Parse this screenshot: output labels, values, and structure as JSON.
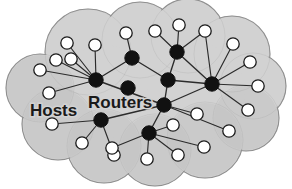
{
  "figure": {
    "width": 292,
    "height": 189,
    "background_color": "#ffffff"
  },
  "cloud": {
    "name": "network-cloud",
    "fill_color": "#d2d2d2",
    "fill_color_dark": "#c2c2c2",
    "stroke_color": "#8f8f8f",
    "stroke_width": 1.1,
    "lobes": [
      {
        "cx": 88,
        "cy": 52,
        "r": 43
      },
      {
        "cx": 140,
        "cy": 40,
        "r": 38
      },
      {
        "cx": 188,
        "cy": 36,
        "r": 37
      },
      {
        "cx": 232,
        "cy": 54,
        "r": 38
      },
      {
        "cx": 253,
        "cy": 86,
        "r": 33
      },
      {
        "cx": 246,
        "cy": 118,
        "r": 33
      },
      {
        "cx": 205,
        "cy": 140,
        "r": 38
      },
      {
        "cx": 155,
        "cy": 150,
        "r": 36
      },
      {
        "cx": 104,
        "cy": 146,
        "r": 37
      },
      {
        "cx": 58,
        "cy": 124,
        "r": 36
      },
      {
        "cx": 40,
        "cy": 88,
        "r": 34
      },
      {
        "cx": 150,
        "cy": 92,
        "r": 62
      },
      {
        "cx": 104,
        "cy": 92,
        "r": 48
      },
      {
        "cx": 196,
        "cy": 92,
        "r": 50
      }
    ]
  },
  "labels": [
    {
      "name": "hosts-label",
      "text": "Hosts",
      "x": 30,
      "y": 116,
      "font_size": 17
    },
    {
      "name": "routers-label",
      "text": "Routers",
      "x": 88,
      "y": 108,
      "font_size": 17
    }
  ],
  "legend": {
    "router_color": "#111111",
    "host_fill": "#ffffff",
    "host_stroke": "#1a1a1a",
    "link_color": "#2b2b2b",
    "router_label": "Routers",
    "host_label": "Hosts"
  },
  "nodes": {
    "routers": [
      {
        "id": "R1",
        "name": "router-top-left",
        "x": 96,
        "y": 80,
        "r": 7.2
      },
      {
        "id": "R2",
        "name": "router-upper-mid",
        "x": 132,
        "y": 58,
        "r": 7.2
      },
      {
        "id": "R3",
        "name": "router-top-center",
        "x": 177,
        "y": 52,
        "r": 7.2
      },
      {
        "id": "R4",
        "name": "router-center",
        "x": 168,
        "y": 80,
        "r": 7.2
      },
      {
        "id": "R5",
        "name": "router-hub",
        "x": 164,
        "y": 105,
        "r": 7.2
      },
      {
        "id": "R6",
        "name": "router-right",
        "x": 212,
        "y": 84,
        "r": 7.2
      },
      {
        "id": "R7",
        "name": "router-mid-stub",
        "x": 128,
        "y": 88,
        "r": 7.2
      },
      {
        "id": "R8",
        "name": "router-lower-left",
        "x": 101,
        "y": 120,
        "r": 7.2
      },
      {
        "id": "R9",
        "name": "router-lower-center",
        "x": 149,
        "y": 133,
        "r": 7.2
      }
    ],
    "hosts": [
      {
        "id": "H1",
        "name": "host-1",
        "x": 56,
        "y": 60,
        "r": 6.2
      },
      {
        "id": "H2",
        "name": "host-2",
        "x": 71,
        "y": 59,
        "r": 6.2
      },
      {
        "id": "H3",
        "name": "host-3",
        "x": 95,
        "y": 45,
        "r": 6.2
      },
      {
        "id": "H4",
        "name": "host-4",
        "x": 67,
        "y": 43,
        "r": 6.2
      },
      {
        "id": "H5",
        "name": "host-5",
        "x": 49,
        "y": 93,
        "r": 6.2
      },
      {
        "id": "H6",
        "name": "host-6",
        "x": 126,
        "y": 33,
        "r": 6.2
      },
      {
        "id": "H7",
        "name": "host-7",
        "x": 155,
        "y": 31,
        "r": 6.2
      },
      {
        "id": "H8",
        "name": "host-8",
        "x": 179,
        "y": 25,
        "r": 6.2
      },
      {
        "id": "H9",
        "name": "host-9",
        "x": 205,
        "y": 31,
        "r": 6.2
      },
      {
        "id": "H10",
        "name": "host-10",
        "x": 233,
        "y": 44,
        "r": 6.2
      },
      {
        "id": "H11",
        "name": "host-11",
        "x": 250,
        "y": 62,
        "r": 6.2
      },
      {
        "id": "H12",
        "name": "host-12",
        "x": 258,
        "y": 86,
        "r": 6.2
      },
      {
        "id": "H13",
        "name": "host-13",
        "x": 248,
        "y": 110,
        "r": 6.2
      },
      {
        "id": "H14",
        "name": "host-14",
        "x": 229,
        "y": 131,
        "r": 6.2
      },
      {
        "id": "H15",
        "name": "host-15",
        "x": 204,
        "y": 147,
        "r": 6.2
      },
      {
        "id": "H16",
        "name": "host-16",
        "x": 178,
        "y": 155,
        "r": 6.2
      },
      {
        "id": "H17",
        "name": "host-17",
        "x": 147,
        "y": 159,
        "r": 6.2
      },
      {
        "id": "H18",
        "name": "host-18",
        "x": 197,
        "y": 114,
        "r": 6.2
      },
      {
        "id": "H19",
        "name": "host-19",
        "x": 173,
        "y": 125,
        "r": 6.2
      },
      {
        "id": "H20",
        "name": "host-20",
        "x": 114,
        "y": 155,
        "r": 6.2
      },
      {
        "id": "H21",
        "name": "host-21",
        "x": 82,
        "y": 143,
        "r": 6.2
      },
      {
        "id": "H22",
        "name": "host-22",
        "x": 52,
        "y": 124,
        "r": 6.2
      },
      {
        "id": "H23",
        "name": "host-23",
        "x": 40,
        "y": 70,
        "r": 6.2
      },
      {
        "id": "H24",
        "name": "host-24",
        "x": 112,
        "y": 148,
        "r": 6.2
      }
    ]
  },
  "links": {
    "router_links": [
      {
        "name": "link-R1-R2",
        "from": "R1",
        "to": "R2"
      },
      {
        "name": "link-R2-R4",
        "from": "R2",
        "to": "R4"
      },
      {
        "name": "link-R3-R4",
        "from": "R3",
        "to": "R4"
      },
      {
        "name": "link-R4-R5",
        "from": "R4",
        "to": "R5"
      },
      {
        "name": "link-R4-R6",
        "from": "R4",
        "to": "R6"
      },
      {
        "name": "link-R5-R6",
        "from": "R5",
        "to": "R6"
      },
      {
        "name": "link-R5-R1",
        "from": "R5",
        "to": "R1"
      },
      {
        "name": "link-R5-R8",
        "from": "R5",
        "to": "R8"
      },
      {
        "name": "link-R5-R9",
        "from": "R5",
        "to": "R9"
      },
      {
        "name": "link-R3-R6",
        "from": "R3",
        "to": "R6"
      }
    ],
    "host_links": [
      {
        "name": "link-H1-R1",
        "from": "H1",
        "to": "R1"
      },
      {
        "name": "link-H2-R1",
        "from": "H2",
        "to": "R1"
      },
      {
        "name": "link-H3-R1",
        "from": "H3",
        "to": "R1"
      },
      {
        "name": "link-H4-R1",
        "from": "H4",
        "to": "R1"
      },
      {
        "name": "link-H23-R1",
        "from": "H23",
        "to": "R1"
      },
      {
        "name": "link-H5-R1",
        "from": "H5",
        "to": "R1"
      },
      {
        "name": "link-H6-R2",
        "from": "H6",
        "to": "R2"
      },
      {
        "name": "link-H7-R3",
        "from": "H7",
        "to": "R3"
      },
      {
        "name": "link-H8-R3",
        "from": "H8",
        "to": "R3"
      },
      {
        "name": "link-H9-R3",
        "from": "H9",
        "to": "R3"
      },
      {
        "name": "link-H9-R6",
        "from": "H9",
        "to": "R6"
      },
      {
        "name": "link-H10-R6",
        "from": "H10",
        "to": "R6"
      },
      {
        "name": "link-H11-R6",
        "from": "H11",
        "to": "R6"
      },
      {
        "name": "link-H12-R6",
        "from": "H12",
        "to": "R6"
      },
      {
        "name": "link-H13-R6",
        "from": "H13",
        "to": "R6"
      },
      {
        "name": "link-H14-R5",
        "from": "H14",
        "to": "R5"
      },
      {
        "name": "link-H18-R5",
        "from": "H18",
        "to": "R5"
      },
      {
        "name": "link-H19-R9",
        "from": "H19",
        "to": "R9"
      },
      {
        "name": "link-H15-R9",
        "from": "H15",
        "to": "R9"
      },
      {
        "name": "link-H16-R9",
        "from": "H16",
        "to": "R9"
      },
      {
        "name": "link-H17-R9",
        "from": "H17",
        "to": "R9"
      },
      {
        "name": "link-H20-R8",
        "from": "H20",
        "to": "R8"
      },
      {
        "name": "link-H21-R8",
        "from": "H21",
        "to": "R8"
      },
      {
        "name": "link-H22-R8",
        "from": "H22",
        "to": "R8"
      },
      {
        "name": "link-H24-R9",
        "from": "H24",
        "to": "R9"
      }
    ]
  }
}
